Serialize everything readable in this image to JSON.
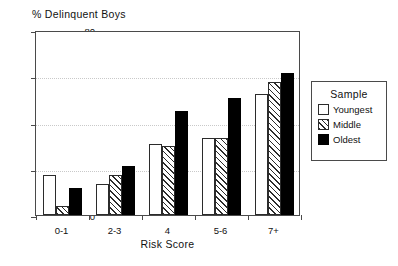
{
  "chart_data": {
    "type": "bar",
    "title": "% Delinquent Boys",
    "xlabel": "Risk Score",
    "ylabel": "",
    "categories": [
      "0-1",
      "2-3",
      "4",
      "5-6",
      "7+"
    ],
    "series": [
      {
        "name": "Youngest",
        "values": [
          17.5,
          13.5,
          30.5,
          33.5,
          52.5
        ],
        "fill": "white",
        "color": "#ffffff"
      },
      {
        "name": "Middle",
        "values": [
          4,
          17.5,
          30,
          33.5,
          57.5
        ],
        "fill": "hatched",
        "color": "#ffffff"
      },
      {
        "name": "Oldest",
        "values": [
          11.5,
          21,
          45,
          50.5,
          61.5
        ],
        "fill": "solid",
        "color": "#000000"
      }
    ],
    "ylim": [
      0,
      80
    ],
    "yticks": [
      0,
      20,
      40,
      60,
      80
    ],
    "ytick_labels": [
      "0",
      "20",
      "40",
      "60",
      "80"
    ],
    "gridlines": [
      20,
      40,
      60
    ],
    "grid": true,
    "legend_position": "right-outside",
    "legend_title": "Sample"
  },
  "legend": {
    "title": "Sample",
    "entries": [
      {
        "label": "Youngest",
        "swatch": "white-square-icon"
      },
      {
        "label": "Middle",
        "swatch": "hatched-square-icon"
      },
      {
        "label": "Oldest",
        "swatch": "black-square-icon"
      }
    ]
  },
  "axes": {
    "y_tick_labels": [
      "80",
      "60",
      "40",
      "20",
      "0"
    ],
    "x_tick_labels": [
      "0-1",
      "2-3",
      "4",
      "5-6",
      "7+"
    ],
    "x_axis_title": "Risk Score",
    "plot_title": "% Delinquent Boys"
  },
  "colors": {
    "axis": "#4a4a4a",
    "grid": "#c9c9c9",
    "bar_outline": "#2b2b2b",
    "oldest": "#000000",
    "background": "#ffffff"
  }
}
